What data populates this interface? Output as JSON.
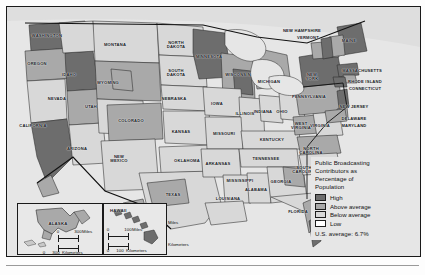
{
  "map": {
    "title": "Public Broadcasting Contributors as Percentage of Population",
    "legend": {
      "title_lines": [
        "Public Broadcasting",
        "Contributors as",
        "Percentage of",
        "Population"
      ],
      "items": [
        {
          "label": "High",
          "color": "#6d6d6d"
        },
        {
          "label": "Above average",
          "color": "#a9a9a9"
        },
        {
          "label": "Below average",
          "color": "#d8d8d8"
        },
        {
          "label": "Low",
          "color": "#ffffff"
        }
      ],
      "average_note": "U.S. average:  6.7%"
    },
    "scale_main": {
      "miles": {
        "ticks": [
          "0",
          "250",
          "500"
        ],
        "unit": "Miles"
      },
      "kilometers": {
        "ticks": [
          "0",
          "250",
          "500"
        ],
        "unit": "Kilometers"
      }
    },
    "insets": {
      "alaska": {
        "name": "ALASKA",
        "scale": {
          "miles": {
            "ticks": [
              "0",
              "300"
            ],
            "unit": "Miles"
          },
          "kilometers": {
            "ticks": [
              "0",
              "300"
            ],
            "unit": "Kilometers"
          }
        }
      },
      "hawaii": {
        "name": "HAWAII",
        "scale": {
          "miles": {
            "ticks": [
              "0",
              "100"
            ],
            "unit": "Miles"
          },
          "kilometers": {
            "ticks": [
              "0",
              "100"
            ],
            "unit": "Kilometers"
          }
        }
      }
    },
    "states": [
      {
        "name": "WASHINGTON",
        "x": 40,
        "y": 27,
        "lines": [
          "WASHINGTON"
        ]
      },
      {
        "name": "OREGON",
        "x": 30,
        "y": 55,
        "lines": [
          "OREGON"
        ]
      },
      {
        "name": "IDAHO",
        "x": 62,
        "y": 66,
        "lines": [
          "IDAHO"
        ]
      },
      {
        "name": "MONTANA",
        "x": 108,
        "y": 36,
        "lines": [
          "MONTANA"
        ]
      },
      {
        "name": "NORTH DAKOTA",
        "x": 169,
        "y": 34,
        "lines": [
          "NORTH",
          "DAKOTA"
        ]
      },
      {
        "name": "SOUTH DAKOTA",
        "x": 169,
        "y": 62,
        "lines": [
          "SOUTH",
          "DAKOTA"
        ]
      },
      {
        "name": "WYOMING",
        "x": 101,
        "y": 74,
        "lines": [
          "WYOMING"
        ]
      },
      {
        "name": "NEBRASKA",
        "x": 167,
        "y": 90,
        "lines": [
          "NEBRASKA"
        ]
      },
      {
        "name": "NEVADA",
        "x": 50,
        "y": 90,
        "lines": [
          "NEVADA"
        ]
      },
      {
        "name": "UTAH",
        "x": 84,
        "y": 98,
        "lines": [
          "UTAH"
        ]
      },
      {
        "name": "CALIFORNIA",
        "x": 26,
        "y": 117,
        "lines": [
          "CALIFORNIA"
        ]
      },
      {
        "name": "COLORADO",
        "x": 124,
        "y": 112,
        "lines": [
          "COLORADO"
        ]
      },
      {
        "name": "KANSAS",
        "x": 174,
        "y": 123,
        "lines": [
          "KANSAS"
        ]
      },
      {
        "name": "ARIZONA",
        "x": 70,
        "y": 140,
        "lines": [
          "ARIZONA"
        ]
      },
      {
        "name": "NEW MEXICO",
        "x": 112,
        "y": 148,
        "lines": [
          "NEW",
          "MEXICO"
        ]
      },
      {
        "name": "OKLAHOMA",
        "x": 180,
        "y": 152,
        "lines": [
          "OKLAHOMA"
        ]
      },
      {
        "name": "TEXAS",
        "x": 166,
        "y": 186,
        "lines": [
          "TEXAS"
        ]
      },
      {
        "name": "MINNESOTA",
        "x": 202,
        "y": 48,
        "lines": [
          "MINNESOTA"
        ]
      },
      {
        "name": "WISCONSIN",
        "x": 231,
        "y": 66,
        "lines": [
          "WISCONSIN"
        ]
      },
      {
        "name": "IOWA",
        "x": 210,
        "y": 95,
        "lines": [
          "IOWA"
        ]
      },
      {
        "name": "MISSOURI",
        "x": 217,
        "y": 125,
        "lines": [
          "MISSOURI"
        ]
      },
      {
        "name": "ARKANSAS",
        "x": 211,
        "y": 155,
        "lines": [
          "ARKANSAS"
        ]
      },
      {
        "name": "LOUISIANA",
        "x": 221,
        "y": 190,
        "lines": [
          "LOUISIANA"
        ]
      },
      {
        "name": "MISSISSIPPI",
        "x": 233,
        "y": 172,
        "lines": [
          "MISSISSIPPI"
        ]
      },
      {
        "name": "ALABAMA",
        "x": 249,
        "y": 181,
        "lines": [
          "ALABAMA"
        ]
      },
      {
        "name": "ILLINOIS",
        "x": 238,
        "y": 105,
        "lines": [
          "ILLINOIS"
        ]
      },
      {
        "name": "INDIANA",
        "x": 256,
        "y": 103,
        "lines": [
          "INDIANA"
        ]
      },
      {
        "name": "OHIO",
        "x": 275,
        "y": 103,
        "lines": [
          "OHIO"
        ]
      },
      {
        "name": "MICHIGAN",
        "x": 262,
        "y": 73,
        "lines": [
          "MICHIGAN"
        ]
      },
      {
        "name": "KENTUCKY",
        "x": 265,
        "y": 131,
        "lines": [
          "KENTUCKY"
        ]
      },
      {
        "name": "TENNESSEE",
        "x": 259,
        "y": 150,
        "lines": [
          "TENNESSEE"
        ]
      },
      {
        "name": "GEORGIA",
        "x": 274,
        "y": 173,
        "lines": [
          "GEORGIA"
        ]
      },
      {
        "name": "FLORIDA",
        "x": 291,
        "y": 203,
        "lines": [
          "FLORIDA"
        ]
      },
      {
        "name": "SOUTH CAROLINA",
        "x": 297,
        "y": 159,
        "lines": [
          "SOUTH",
          "CAROLINA"
        ]
      },
      {
        "name": "NORTH CAROLINA",
        "x": 304,
        "y": 140,
        "lines": [
          "NORTH",
          "CAROLINA"
        ]
      },
      {
        "name": "WEST VIRGINIA",
        "x": 294,
        "y": 115,
        "lines": [
          "WEST",
          "VIRGINIA"
        ]
      },
      {
        "name": "VIRGINIA",
        "x": 313,
        "y": 117,
        "lines": [
          "VIRGINIA"
        ]
      },
      {
        "name": "PENNSYLVANIA",
        "x": 302,
        "y": 88,
        "lines": [
          "PENNSYLVANIA"
        ]
      },
      {
        "name": "NEW YORK",
        "x": 305,
        "y": 66,
        "lines": [
          "NEW",
          "YORK"
        ]
      },
      {
        "name": "MAINE",
        "x": 342,
        "y": 32,
        "lines": [
          "MAINE"
        ]
      },
      {
        "name": "NEW HAMPSHIRE",
        "x": 295,
        "y": 22,
        "lines": [
          "NEW HAMPSHIRE"
        ]
      },
      {
        "name": "VERMONT",
        "x": 301,
        "y": 29,
        "lines": [
          "VERMONT"
        ]
      },
      {
        "name": "MASSACHUSETTS",
        "x": 355,
        "y": 62,
        "lines": [
          "MASSACHUSETTS"
        ]
      },
      {
        "name": "RHODE ISLAND",
        "x": 358,
        "y": 73,
        "lines": [
          "RHODE ISLAND"
        ]
      },
      {
        "name": "CONNECTICUT",
        "x": 358,
        "y": 80,
        "lines": [
          "CONNECTICUT"
        ]
      },
      {
        "name": "NEW JERSEY",
        "x": 347,
        "y": 98,
        "lines": [
          "NEW JERSEY"
        ]
      },
      {
        "name": "DELAWARE",
        "x": 347,
        "y": 110,
        "lines": [
          "DELAWARE"
        ]
      },
      {
        "name": "MARYLAND",
        "x": 347,
        "y": 117,
        "lines": [
          "MARYLAND"
        ]
      }
    ]
  }
}
